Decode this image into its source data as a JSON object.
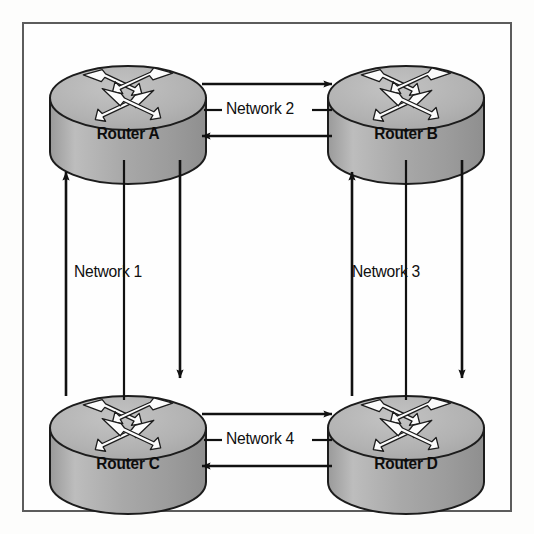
{
  "diagram": {
    "frame": {
      "border_color": "#5c5c5c"
    },
    "background_color": "#fdfdfc",
    "routers": [
      {
        "id": "a",
        "label": "Router A",
        "position": "top-left",
        "cx": 128,
        "cy": 98,
        "rx": 78,
        "ry": 32,
        "body_h": 54
      },
      {
        "id": "b",
        "label": "Router B",
        "position": "top-right",
        "cx": 406,
        "cy": 98,
        "rx": 78,
        "ry": 32,
        "body_h": 54
      },
      {
        "id": "c",
        "label": "Router C",
        "position": "bottom-left",
        "cx": 128,
        "cy": 428,
        "rx": 78,
        "ry": 32,
        "body_h": 54
      },
      {
        "id": "d",
        "label": "Router D",
        "position": "bottom-right",
        "cx": 406,
        "cy": 428,
        "rx": 78,
        "ry": 32,
        "body_h": 54
      }
    ],
    "networks": [
      {
        "id": "n1",
        "label": "Network 1",
        "orientation": "vertical",
        "between": [
          "Router A",
          "Router C"
        ],
        "label_x": 74,
        "label_y": 272
      },
      {
        "id": "n2",
        "label": "Network 2",
        "orientation": "horizontal",
        "between": [
          "Router A",
          "Router B"
        ],
        "label_x": 226,
        "label_y": 104
      },
      {
        "id": "n3",
        "label": "Network 3",
        "orientation": "vertical",
        "between": [
          "Router B",
          "Router D"
        ],
        "label_x": 352,
        "label_y": 272
      },
      {
        "id": "n4",
        "label": "Network 4",
        "orientation": "horizontal",
        "between": [
          "Router C",
          "Router D"
        ],
        "label_x": 226,
        "label_y": 434
      }
    ],
    "colors": {
      "router_top": "#b4b4b4",
      "router_body": "#a6a6a6",
      "router_outline": "#1c1c1c",
      "arrow_fill": "#fafafa",
      "line": "#111111"
    },
    "icon_names": {
      "router": "router-icon",
      "arrow_cross": "crossed-arrows-icon"
    }
  }
}
